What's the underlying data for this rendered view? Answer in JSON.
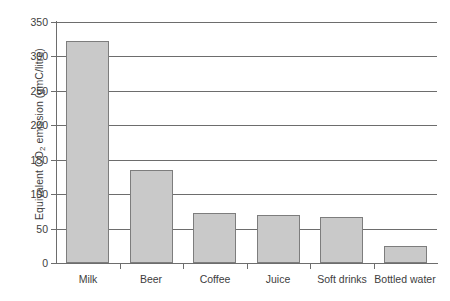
{
  "chart_data": {
    "type": "bar",
    "title": "",
    "xlabel": "",
    "ylabel": "Equivalent CO2 emission (gmC/litre)",
    "ylabel_prefix": "Equivalent CO",
    "ylabel_sub": "2",
    "ylabel_suffix": " emission (gmC/litre)",
    "categories": [
      "Milk",
      "Beer",
      "Coffee",
      "Juice",
      "Soft drinks",
      "Bottled water"
    ],
    "values": [
      322,
      135,
      72,
      70,
      67,
      25
    ],
    "ylim": [
      0,
      350
    ],
    "yticks": [
      0,
      50,
      100,
      150,
      200,
      250,
      300,
      350
    ],
    "ytick_labels": [
      "0",
      "50",
      "100",
      "150",
      "200",
      "250",
      "300",
      "350"
    ],
    "grid": true,
    "grid_axis": "y",
    "legend": false,
    "bar_fill_color": "#c9c9c9",
    "bar_border_color": "#7d7d7d",
    "axis_color": "#6d6d6d",
    "background_color": "#ffffff"
  }
}
